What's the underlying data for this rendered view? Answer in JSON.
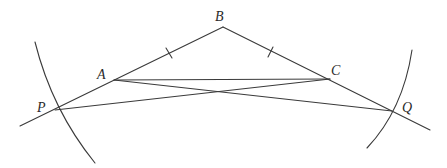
{
  "diagram": {
    "type": "geometric-construction",
    "points": {
      "A": {
        "label": "A",
        "x": 114,
        "y": 80
      },
      "B": {
        "label": "B",
        "x": 223,
        "y": 27
      },
      "C": {
        "label": "C",
        "x": 330,
        "y": 79
      },
      "P": {
        "label": "P",
        "x": 55,
        "y": 110
      },
      "Q": {
        "label": "Q",
        "x": 392,
        "y": 111
      }
    },
    "segments": [
      {
        "from": "B",
        "to": "P",
        "extends_past": "P",
        "note": "line BA extended through P"
      },
      {
        "from": "B",
        "to": "Q",
        "extends_past": "Q",
        "note": "line BC extended through Q"
      },
      {
        "from": "A",
        "to": "C"
      },
      {
        "from": "A",
        "to": "Q"
      },
      {
        "from": "P",
        "to": "C"
      }
    ],
    "tick_marks": [
      {
        "on": "AB",
        "meaning": "equal length"
      },
      {
        "on": "BC",
        "meaning": "equal length"
      }
    ],
    "arcs": [
      {
        "through": "P",
        "side": "left"
      },
      {
        "through": "Q",
        "side": "right"
      }
    ],
    "stroke_color": "#3a3a3a",
    "background": "#ffffff"
  }
}
